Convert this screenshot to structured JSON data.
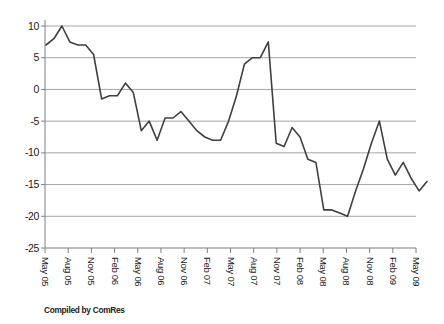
{
  "chart_data": {
    "type": "line",
    "title": "",
    "xlabel": "",
    "ylabel": "",
    "categories": [
      "May 05",
      "Jun 05",
      "Jul 05",
      "Aug 05",
      "Sep 05",
      "Oct 05",
      "Nov 05",
      "Dec 05",
      "Jan 06",
      "Feb 06",
      "Mar 06",
      "Apr 06",
      "May 06",
      "Jun 06",
      "Jul 06",
      "Aug 06",
      "Sep 06",
      "Oct 06",
      "Nov 06",
      "Dec 06",
      "Jan 07",
      "Feb 07",
      "Mar 07",
      "Apr 07",
      "May 07",
      "Jun 07",
      "Jul 07",
      "Aug 07",
      "Sep 07",
      "Oct 07",
      "Nov 07",
      "Dec 07",
      "Jan 08",
      "Feb 08",
      "Mar 08",
      "Apr 08",
      "May 08",
      "Jun 08",
      "Jul 08",
      "Aug 08",
      "Sep 08",
      "Oct 08",
      "Nov 08",
      "Dec 08",
      "Jan 09",
      "Feb 09",
      "Mar 09",
      "Apr 09",
      "May 09"
    ],
    "values": [
      7,
      8,
      10,
      7.5,
      7,
      7,
      5.5,
      -1.5,
      -1,
      -1,
      1,
      -0.5,
      -6.5,
      -5,
      -8,
      -4.5,
      -4.5,
      -3.5,
      -5,
      -6.5,
      -7.5,
      -8,
      -8,
      -5,
      -1,
      4,
      5,
      5,
      7.5,
      -8.5,
      -9,
      -6,
      -7.5,
      -11,
      -11.5,
      -19,
      -19,
      -19.5,
      -20,
      -16,
      -12.5,
      -8.5,
      -5,
      -11,
      -13.5,
      -11.5,
      -14,
      -16,
      -14.5
    ],
    "x_tick_labels": [
      "May 05",
      "Aug 05",
      "Nov 05",
      "Feb 06",
      "May 06",
      "Aug 06",
      "Nov 06",
      "Feb 07",
      "May 07",
      "Aug 07",
      "Nov 07",
      "Feb 08",
      "May 08",
      "Aug 08",
      "Nov 08",
      "Feb 09",
      "May 09"
    ],
    "y_ticks": [
      10,
      5,
      0,
      -5,
      -10,
      -15,
      -20,
      -25
    ],
    "ylim": [
      -25,
      10
    ],
    "grid": true,
    "legend_position": "none",
    "line_color": "#3f3f3f",
    "gridline_color": "#a6a6a6",
    "axis_color": "#7f7f7f",
    "footnote": "Compiled by ComRes"
  }
}
